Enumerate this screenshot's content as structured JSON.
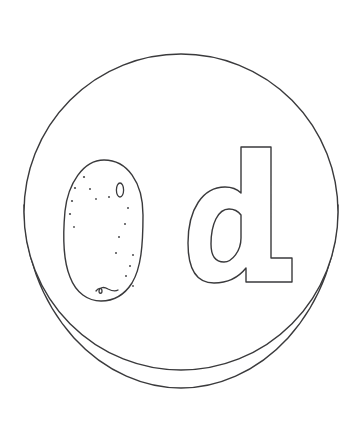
{
  "page": {
    "kind": "coloring-page",
    "background_color": "#ffffff",
    "line_color": "#3a3a3c",
    "fill_color": "#ffffff",
    "width": 359,
    "height": 425,
    "caption": ""
  },
  "artwork": {
    "title": "Letter d with potato on a plate",
    "style": "black and white line art outline",
    "elements": [
      {
        "name": "plate",
        "label": "Plate",
        "description": "Large circular plate seen at a slight angle with a rim line along the lower edge",
        "stroke": "#3a3a3c",
        "stroke_width": 1.4,
        "center_x": 181,
        "center_y": 212,
        "radius_x": 157,
        "radius_y": 158
      },
      {
        "name": "plate-rim",
        "label": "Plate rim",
        "description": "Second arc below the plate outline forming the visible rim thickness",
        "stroke": "#3a3a3c",
        "stroke_width": 1.4
      },
      {
        "name": "potato",
        "label": "Potato",
        "description": "Speckled oval potato resting on the left side of the plate",
        "stroke": "#3a3a3c",
        "stroke_width": 1.4,
        "center_x": 103,
        "center_y": 230,
        "radius_x": 40,
        "radius_y": 71,
        "speck_count": 16,
        "eye_mark": "small vertical oval eye near upper right",
        "sprout_mark": "small curled sprout at the bottom"
      },
      {
        "name": "letter-d",
        "label": "d",
        "description": "Lowercase letter d drawn as a hollow outline on the right side of the plate",
        "stroke": "#3a3a3c",
        "stroke_width": 1.4,
        "bounds": {
          "x": 188,
          "y": 147,
          "width": 105,
          "height": 136
        }
      }
    ],
    "specks": [
      {
        "cx": 75,
        "cy": 188,
        "r": 1.1
      },
      {
        "cx": 84,
        "cy": 177,
        "r": 1.1
      },
      {
        "cx": 90,
        "cy": 189,
        "r": 1.0
      },
      {
        "cx": 72,
        "cy": 201,
        "r": 1.1
      },
      {
        "cx": 70,
        "cy": 214,
        "r": 1.1
      },
      {
        "cx": 74,
        "cy": 227,
        "r": 0.9
      },
      {
        "cx": 109,
        "cy": 197,
        "r": 1.0
      },
      {
        "cx": 96,
        "cy": 199,
        "r": 0.9
      },
      {
        "cx": 128,
        "cy": 208,
        "r": 1.0
      },
      {
        "cx": 125,
        "cy": 224,
        "r": 1.0
      },
      {
        "cx": 119,
        "cy": 237,
        "r": 1.0
      },
      {
        "cx": 116,
        "cy": 253,
        "r": 1.0
      },
      {
        "cx": 133,
        "cy": 255,
        "r": 1.0
      },
      {
        "cx": 130,
        "cy": 266,
        "r": 1.0
      },
      {
        "cx": 126,
        "cy": 276,
        "r": 1.0
      },
      {
        "cx": 133,
        "cy": 286,
        "r": 0.9
      }
    ]
  }
}
